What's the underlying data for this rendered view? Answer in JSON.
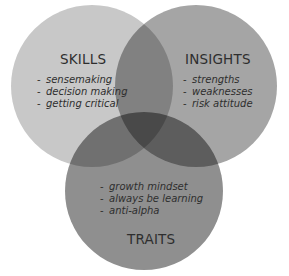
{
  "diagram": {
    "type": "venn",
    "sets": [
      {
        "id": "skills",
        "title": "SKILLS",
        "color": "#c8c8c8",
        "items": [
          "sensemaking",
          "decision making",
          "getting critical"
        ]
      },
      {
        "id": "insights",
        "title": "INSIGHTS",
        "color": "#a5a5a5",
        "items": [
          "strengths",
          "weaknesses",
          "risk attitude"
        ]
      },
      {
        "id": "traits",
        "title": "TRAITS",
        "color": "#8f8f8f",
        "items": [
          "growth mindset",
          "always be learning",
          "anti-alpha"
        ]
      }
    ],
    "bullet": "-"
  }
}
